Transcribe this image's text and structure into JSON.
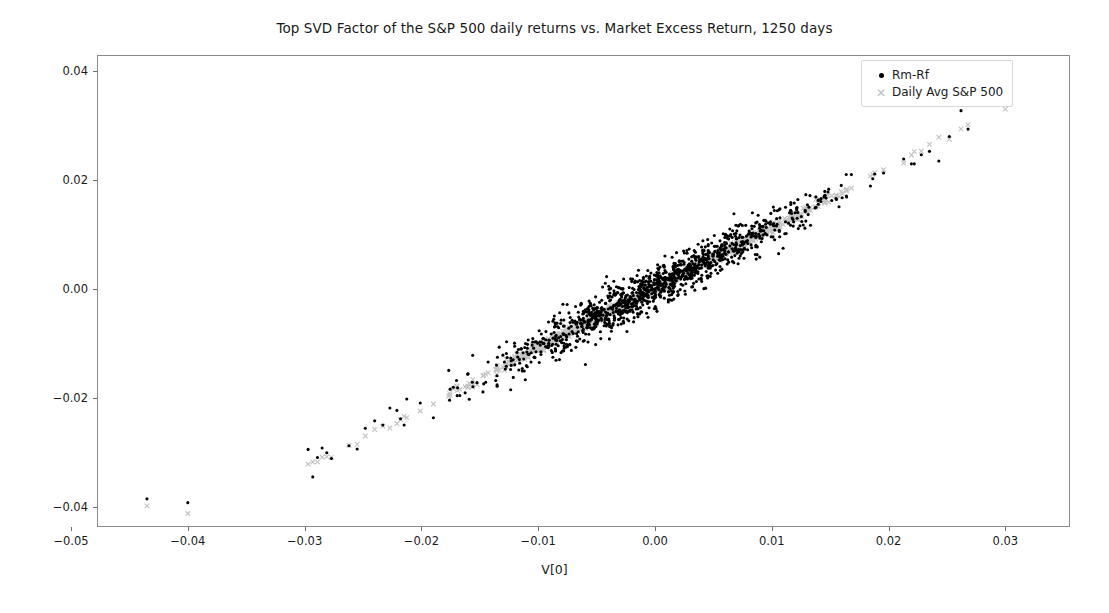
{
  "chart_data": {
    "type": "scatter",
    "title": "Top SVD Factor of the S&P 500 daily returns vs. Market Excess Return, 1250 days",
    "xlabel": "V[0]",
    "ylabel": "",
    "xlim": [
      -0.0534,
      -0.0534
    ],
    "ylim": [
      -0.0466,
      0.0466
    ],
    "xticks": [
      -0.05,
      -0.04,
      -0.03,
      -0.02,
      -0.01,
      0.0,
      0.01,
      0.02,
      0.03
    ],
    "xtick_labels": [
      "−0.05",
      "−0.04",
      "−0.03",
      "−0.02",
      "−0.01",
      "0.00",
      "0.01",
      "0.02",
      "0.03"
    ],
    "yticks": [
      -0.04,
      -0.02,
      0.0,
      0.02,
      0.04
    ],
    "ytick_labels": [
      "−0.04",
      "−0.02",
      "0.00",
      "0.02",
      "0.04"
    ],
    "grid": false,
    "legend_position": "upper right",
    "n_days": 1250,
    "series": [
      {
        "name": "Rm-Rf",
        "marker": "dot",
        "color": "#000000",
        "marker_size": 3.1,
        "n_points": 1250,
        "relation": "y = 1.10*x + 0.0002 with gaussian noise sd 0.0019",
        "slope": 1.1,
        "intercept": 0.0002,
        "noise_sd": 0.0019,
        "outliers": [
          [
            -0.0435,
            -0.0385
          ],
          [
            -0.04,
            -0.0392
          ]
        ]
      },
      {
        "name": "Daily Avg S&P 500",
        "marker": "x",
        "color": "#c4c4c4",
        "marker_size": 4.6,
        "n_points": 1250,
        "relation": "y = 1.10*x + 0.0002 with gaussian noise sd 0.00042",
        "slope": 1.1,
        "intercept": 0.0002,
        "noise_sd": 0.00042,
        "outliers": [
          [
            -0.0435,
            -0.0398
          ],
          [
            -0.04,
            -0.0412
          ],
          [
            0.03,
            0.033
          ]
        ]
      }
    ],
    "x_distribution": {
      "core_sd": 0.0068,
      "core_clip": [
        -0.0205,
        0.0215
      ],
      "tail_points_x": [
        -0.0297,
        -0.0293,
        -0.0289,
        -0.0285,
        -0.0281,
        -0.0277,
        -0.0262,
        -0.0255,
        -0.0248,
        -0.024,
        -0.0233,
        -0.0227,
        -0.0221,
        0.0222,
        0.0228,
        0.0235,
        0.0243,
        0.0252,
        0.0262,
        0.0268
      ]
    }
  },
  "legend": {
    "items": [
      {
        "label": "Rm-Rf",
        "marker": "dot"
      },
      {
        "label": "Daily Avg S&P 500",
        "marker": "x"
      }
    ]
  }
}
